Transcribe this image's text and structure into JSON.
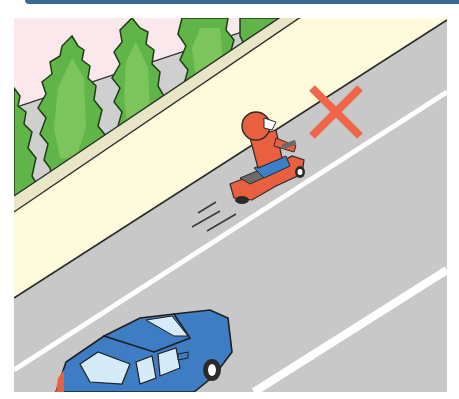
{
  "illustration": {
    "subject": "motorcycle riding on road shoulder beside sidewalk, marked incorrect",
    "elements": {
      "trees": {
        "count": 5,
        "color": "#5fb548"
      },
      "sidewalk": {
        "color": "#fdfbdc"
      },
      "road": {
        "color": "#c8c8c8"
      },
      "lane_line": {
        "color": "#ffffff"
      },
      "motorcycle_rider": {
        "helmet_color": "#e8603f",
        "pants_color": "#3c7fc8",
        "scooter_color": "#e8603f"
      },
      "car": {
        "color": "#3e7cc4"
      },
      "mark": {
        "symbol": "×",
        "meaning": "wrong",
        "color": "#f0664b"
      }
    }
  },
  "colors": {
    "header_bar": "#3a6a92",
    "sky": "#fbe8ec",
    "curb": "#e9e6c8",
    "outline": "#2a2a2a"
  }
}
